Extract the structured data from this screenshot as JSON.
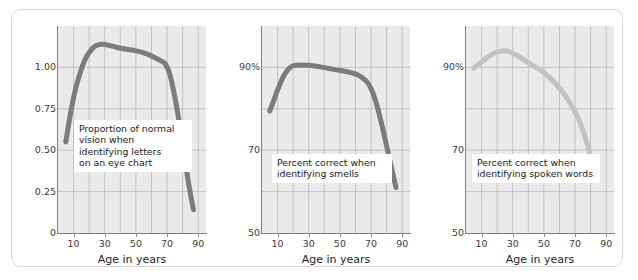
{
  "figure": {
    "background": "#ffffff",
    "frame_color": "#d8d8d8",
    "panel_bg": "#eaeaea",
    "grid_color": "#b9b9b9",
    "axis_color": "#7d7d7d",
    "shared_xlabel": "Age in years"
  },
  "chart_data": [
    {
      "type": "line",
      "title": "",
      "annotation": "Proportion of normal\nvision when\nidentifying letters\non an eye chart",
      "xlabel": "Age in years",
      "ylabel": "",
      "xlim": [
        0,
        95
      ],
      "ylim": [
        0,
        1.25
      ],
      "xticks": [
        10,
        30,
        50,
        70,
        90
      ],
      "xtick_labels": [
        "10",
        "30",
        "50",
        "70",
        "90"
      ],
      "yticks": [
        0,
        0.25,
        0.5,
        0.75,
        1.0
      ],
      "ytick_labels": [
        "0",
        "0.25",
        "0.50",
        "0.75",
        "1.00"
      ],
      "x_gridlines": [
        10,
        20,
        30,
        40,
        50,
        60,
        70,
        80,
        90
      ],
      "y_gridlines": [
        0.25,
        0.5,
        0.75,
        1.0
      ],
      "grid": true,
      "legend": "none",
      "line_color": "#7c7c7c",
      "line_width": 5,
      "x": [
        5,
        8,
        11,
        14,
        17,
        20,
        24,
        28,
        32,
        38,
        44,
        50,
        56,
        62,
        66,
        69,
        72,
        75,
        78,
        81,
        84,
        87
      ],
      "y": [
        0.55,
        0.72,
        0.86,
        0.96,
        1.04,
        1.09,
        1.13,
        1.14,
        1.135,
        1.12,
        1.11,
        1.1,
        1.085,
        1.06,
        1.04,
        1.02,
        0.95,
        0.82,
        0.66,
        0.48,
        0.29,
        0.14
      ]
    },
    {
      "type": "line",
      "title": "",
      "annotation": "Percent correct when\nidentifying smells",
      "xlabel": "Age in years",
      "ylabel": "",
      "xlim": [
        0,
        95
      ],
      "ylim": [
        50,
        100
      ],
      "xticks": [
        10,
        30,
        50,
        70,
        90
      ],
      "xtick_labels": [
        "10",
        "30",
        "50",
        "70",
        "90"
      ],
      "yticks": [
        50,
        70,
        90
      ],
      "ytick_labels": [
        "50",
        "70",
        "90%"
      ],
      "x_gridlines": [
        10,
        20,
        30,
        40,
        50,
        60,
        70,
        80,
        90
      ],
      "y_gridlines": [
        60,
        70,
        80,
        90
      ],
      "grid": true,
      "legend": "none",
      "line_color": "#7c7c7c",
      "line_width": 5,
      "x": [
        5,
        8,
        11,
        14,
        17,
        20,
        24,
        30,
        36,
        42,
        48,
        54,
        60,
        64,
        68,
        71,
        74,
        77,
        80,
        83,
        86
      ],
      "y": [
        79.5,
        82.5,
        85.5,
        88.0,
        89.6,
        90.4,
        90.6,
        90.5,
        90.2,
        89.8,
        89.4,
        89.0,
        88.4,
        87.6,
        86.2,
        84.0,
        80.5,
        76.0,
        71.0,
        66.0,
        61.0
      ]
    },
    {
      "type": "line",
      "title": "",
      "annotation": "Percent correct when\nidentifying spoken words",
      "xlabel": "Age in years",
      "ylabel": "",
      "xlim": [
        0,
        95
      ],
      "ylim": [
        50,
        100
      ],
      "xticks": [
        10,
        30,
        50,
        70,
        90
      ],
      "xtick_labels": [
        "10",
        "30",
        "50",
        "70",
        "90"
      ],
      "yticks": [
        50,
        70,
        90
      ],
      "ytick_labels": [
        "50",
        "70",
        "90%"
      ],
      "x_gridlines": [
        10,
        20,
        30,
        40,
        50,
        60,
        70,
        80,
        90
      ],
      "y_gridlines": [
        60,
        70,
        80,
        90
      ],
      "grid": true,
      "legend": "none",
      "line_color": "#c2c2c2",
      "line_width": 5,
      "x": [
        5,
        9,
        13,
        17,
        21,
        25,
        29,
        34,
        39,
        44,
        49,
        54,
        59,
        64,
        69,
        73,
        77,
        80,
        83
      ],
      "y": [
        89.8,
        91.0,
        92.2,
        93.2,
        93.8,
        94.0,
        93.6,
        92.6,
        91.4,
        90.2,
        89.0,
        87.4,
        85.4,
        83.0,
        80.0,
        76.8,
        72.5,
        68.5,
        64.5
      ]
    }
  ]
}
